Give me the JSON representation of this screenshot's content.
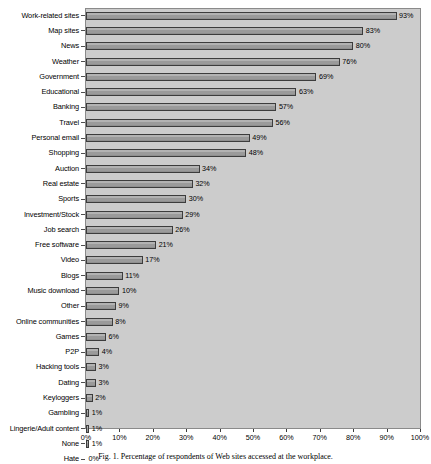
{
  "chart_data": {
    "type": "bar",
    "orientation": "horizontal",
    "title": "",
    "xlabel": "",
    "ylabel": "",
    "xlim": [
      0,
      100
    ],
    "xticks": [
      "0%",
      "10%",
      "20%",
      "30%",
      "40%",
      "50%",
      "60%",
      "70%",
      "80%",
      "90%",
      "100%"
    ],
    "xtick_values": [
      0,
      10,
      20,
      30,
      40,
      50,
      60,
      70,
      80,
      90,
      100
    ],
    "grid": false,
    "legend": "none",
    "categories": [
      "Work-related sites",
      "Map sites",
      "News",
      "Weather",
      "Government",
      "Educational",
      "Banking",
      "Travel",
      "Personal email",
      "Shopping",
      "Auction",
      "Real estate",
      "Sports",
      "Investment/Stock",
      "Job search",
      "Free software",
      "Video",
      "Blogs",
      "Music download",
      "Other",
      "Online communities",
      "Games",
      "P2P",
      "Hacking tools",
      "Dating",
      "Keyloggers",
      "Gambling",
      "Lingerie/Adult content",
      "None",
      "Hate"
    ],
    "values": [
      93,
      83,
      80,
      76,
      69,
      63,
      57,
      56,
      49,
      48,
      34,
      32,
      30,
      29,
      26,
      21,
      17,
      11,
      10,
      9,
      8,
      6,
      4,
      3,
      3,
      2,
      1,
      1,
      1,
      0
    ],
    "value_labels": [
      "93%",
      "83%",
      "80%",
      "76%",
      "69%",
      "63%",
      "57%",
      "56%",
      "49%",
      "48%",
      "34%",
      "32%",
      "30%",
      "29%",
      "26%",
      "21%",
      "17%",
      "11%",
      "10%",
      "9%",
      "8%",
      "6%",
      "4%",
      "3%",
      "3%",
      "2%",
      "1%",
      "1%",
      "1%",
      "0%"
    ],
    "colors": {
      "bar_fill": "#a0a0a0",
      "bar_edge": "#3c3c3c",
      "plot_background": "#cccccc",
      "page_background": "#ffffff",
      "text": "#000000"
    }
  },
  "caption": {
    "text": "Fig. 1. Percentage of respondents of Web sites accessed at the workplace."
  }
}
